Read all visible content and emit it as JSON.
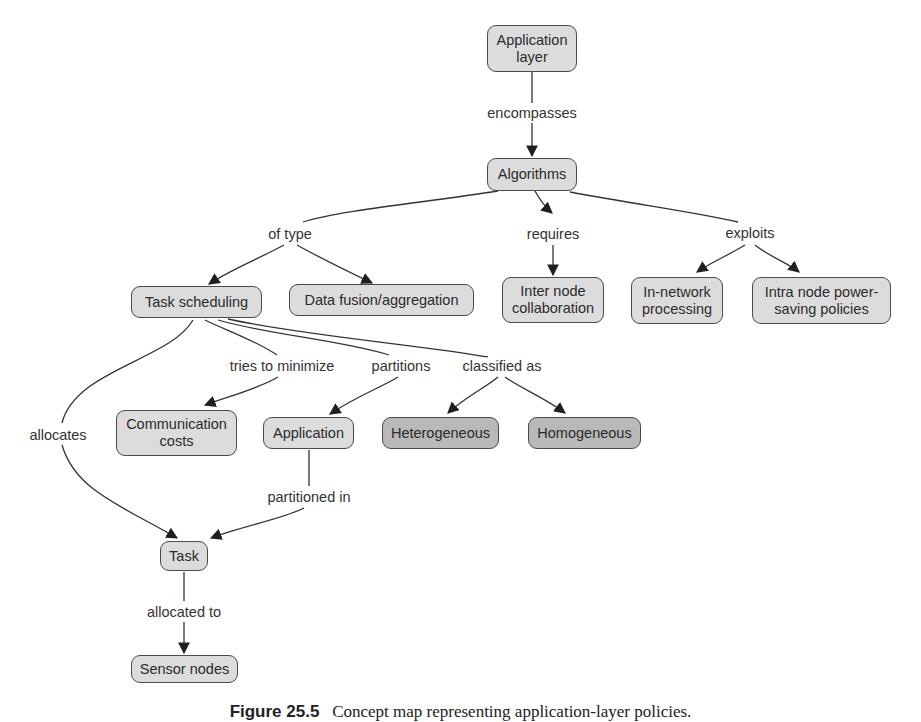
{
  "diagram": {
    "type": "concept-map",
    "nodes": {
      "application_layer": {
        "label": "Application\nlayer",
        "shade": "light"
      },
      "algorithms": {
        "label": "Algorithms",
        "shade": "light"
      },
      "task_scheduling": {
        "label": "Task scheduling",
        "shade": "light"
      },
      "data_fusion": {
        "label": "Data fusion/aggregation",
        "shade": "light"
      },
      "inter_node": {
        "label": "Inter node\ncollaboration",
        "shade": "light"
      },
      "in_network": {
        "label": "In-network\nprocessing",
        "shade": "light"
      },
      "intra_node": {
        "label": "Intra node power-\nsaving policies",
        "shade": "light"
      },
      "communication_costs": {
        "label": "Communication\ncosts",
        "shade": "light"
      },
      "application": {
        "label": "Application",
        "shade": "light"
      },
      "heterogeneous": {
        "label": "Heterogeneous",
        "shade": "dark"
      },
      "homogeneous": {
        "label": "Homogeneous",
        "shade": "dark"
      },
      "task": {
        "label": "Task",
        "shade": "light"
      },
      "sensor_nodes": {
        "label": "Sensor nodes",
        "shade": "light"
      }
    },
    "links": {
      "encompasses": {
        "label": "encompasses",
        "from": "application_layer",
        "to": [
          "algorithms"
        ]
      },
      "of_type": {
        "label": "of type",
        "from": "algorithms",
        "to": [
          "task_scheduling",
          "data_fusion"
        ]
      },
      "requires": {
        "label": "requires",
        "from": "algorithms",
        "to": [
          "inter_node"
        ]
      },
      "exploits": {
        "label": "exploits",
        "from": "algorithms",
        "to": [
          "in_network",
          "intra_node"
        ]
      },
      "tries_to_minimize": {
        "label": "tries to minimize",
        "from": "task_scheduling",
        "to": [
          "communication_costs"
        ]
      },
      "partitions": {
        "label": "partitions",
        "from": "task_scheduling",
        "to": [
          "application"
        ]
      },
      "classified_as": {
        "label": "classified as",
        "from": "task_scheduling",
        "to": [
          "heterogeneous",
          "homogeneous"
        ]
      },
      "allocates": {
        "label": "allocates",
        "from": "task_scheduling",
        "to": [
          "task"
        ]
      },
      "partitioned_in": {
        "label": "partitioned in",
        "from": "application",
        "to": [
          "task"
        ]
      },
      "allocated_to": {
        "label": "allocated to",
        "from": "task",
        "to": [
          "sensor_nodes"
        ]
      }
    },
    "colors": {
      "light_node": "#dcdcdc",
      "dark_node": "#b9b9b9",
      "border": "#4a4a4a",
      "line": "#333333"
    }
  },
  "caption": {
    "prefix": "Figure 25.5",
    "text": "Concept map representing application-layer policies."
  }
}
